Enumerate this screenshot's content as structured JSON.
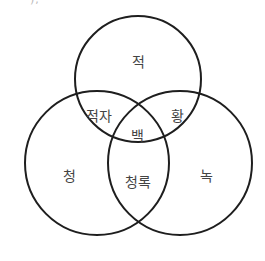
{
  "figure": {
    "top_fragment": "),",
    "circles": [
      {
        "name": "red",
        "cx": 138,
        "cy": 79,
        "r": 63
      },
      {
        "name": "blue",
        "cx": 97,
        "cy": 163,
        "r": 72
      },
      {
        "name": "green",
        "cx": 180,
        "cy": 163,
        "r": 72
      }
    ],
    "labels": {
      "red": "적",
      "magenta": "적자",
      "yellow": "황",
      "white": "백",
      "blue": "청",
      "cyan": "청록",
      "green": "녹"
    },
    "stroke_color": "#1e1e1e",
    "label_color": "#444444"
  }
}
